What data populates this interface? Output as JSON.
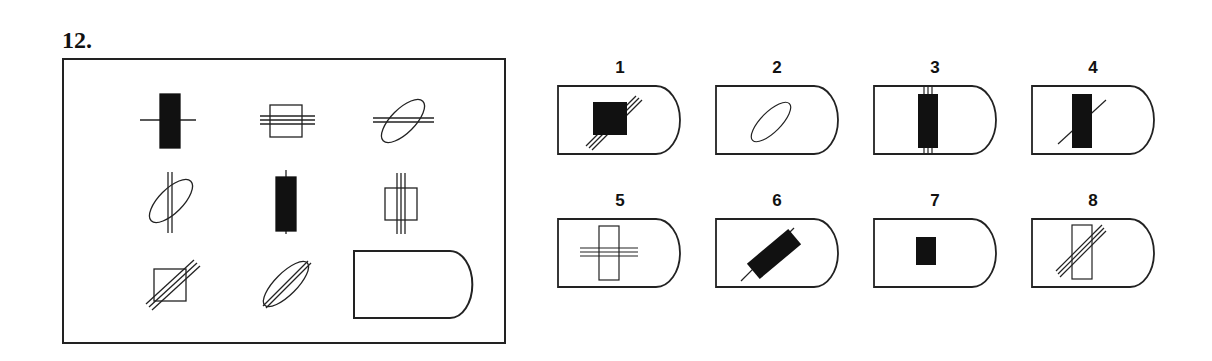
{
  "question": {
    "number": "12."
  },
  "matrix": {
    "rows": 3,
    "cols": 3,
    "cells": [
      {
        "row": 1,
        "col": 1,
        "shape": "filled-tall-rectangle",
        "lines": 1,
        "line_orientation": "horizontal"
      },
      {
        "row": 1,
        "col": 2,
        "shape": "empty-square",
        "lines": 3,
        "line_orientation": "horizontal"
      },
      {
        "row": 1,
        "col": 3,
        "shape": "empty-ellipse-tilted",
        "lines": 2,
        "line_orientation": "horizontal"
      },
      {
        "row": 2,
        "col": 1,
        "shape": "empty-ellipse-tilted",
        "lines": 2,
        "line_orientation": "vertical"
      },
      {
        "row": 2,
        "col": 2,
        "shape": "filled-tall-rectangle",
        "lines": 1,
        "line_orientation": "vertical"
      },
      {
        "row": 2,
        "col": 3,
        "shape": "empty-square",
        "lines": 3,
        "line_orientation": "vertical"
      },
      {
        "row": 3,
        "col": 1,
        "shape": "empty-square",
        "lines": 3,
        "line_orientation": "diagonal"
      },
      {
        "row": 3,
        "col": 2,
        "shape": "empty-ellipse-tilted",
        "lines": 2,
        "line_orientation": "diagonal"
      },
      {
        "row": 3,
        "col": 3,
        "shape": "missing",
        "lines": 0,
        "line_orientation": "none"
      }
    ]
  },
  "options": [
    {
      "label": "1",
      "description": "filled square with 3 diagonal lines"
    },
    {
      "label": "2",
      "description": "empty tilted ellipse, no lines"
    },
    {
      "label": "3",
      "description": "filled tall rectangle with 3 vertical lines"
    },
    {
      "label": "4",
      "description": "filled tall rectangle with 1 diagonal line"
    },
    {
      "label": "5",
      "description": "empty tall rectangle with 3 horizontal lines"
    },
    {
      "label": "6",
      "description": "filled rectangle rotated diagonally with 1 diagonal line"
    },
    {
      "label": "7",
      "description": "small filled rectangle, no lines"
    },
    {
      "label": "8",
      "description": "empty tall rectangle with 3 diagonal lines"
    }
  ],
  "colors": {
    "ink": "#111111",
    "background": "#ffffff"
  }
}
